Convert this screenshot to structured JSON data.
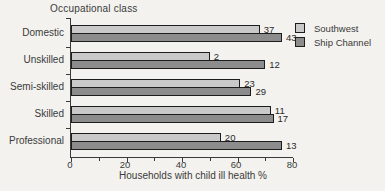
{
  "chart_data": {
    "type": "bar",
    "orientation": "horizontal",
    "title": "Occupational class",
    "xlabel": "Households with child ill health %",
    "xlim": [
      0,
      80
    ],
    "xticks": [
      0,
      20,
      40,
      60,
      80
    ],
    "grid": false,
    "legend_position": "top-right",
    "categories": [
      "Domestic",
      "Unskilled",
      "Semi-skilled",
      "Skilled",
      "Professional"
    ],
    "series": [
      {
        "name": "Southwest",
        "color": "#c9c9c9",
        "values": [
          68,
          50,
          61,
          72,
          54
        ],
        "bar_labels": [
          37,
          2,
          23,
          11,
          20
        ]
      },
      {
        "name": "Ship Channel",
        "color": "#8c8c8c",
        "values": [
          76,
          70,
          65,
          73,
          76
        ],
        "bar_labels": [
          43,
          12,
          29,
          17,
          13
        ]
      }
    ]
  }
}
